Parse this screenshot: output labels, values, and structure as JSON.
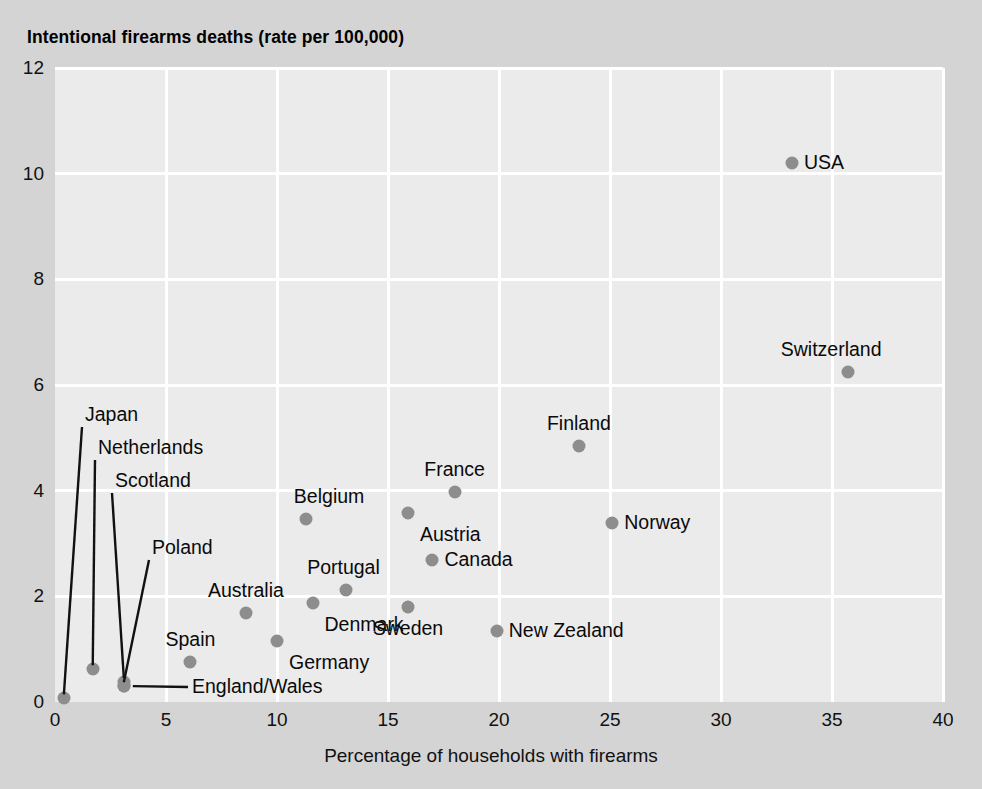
{
  "chart_data": {
    "type": "scatter",
    "title": "Intentional firearms deaths (rate per 100,000)",
    "xlabel": "Percentage of households with firearms",
    "ylabel": "",
    "xlim": [
      0,
      40
    ],
    "ylim": [
      0,
      12
    ],
    "xticks": [
      0,
      5,
      10,
      15,
      20,
      25,
      30,
      35,
      40
    ],
    "yticks": [
      0,
      2,
      4,
      6,
      8,
      10,
      12
    ],
    "grid": true,
    "legend": "none",
    "marker_color": "#8d8d8d",
    "plot_background": "#ebebeb",
    "figure_background": "#d4d4d4",
    "points": [
      {
        "label": "USA",
        "x": 33.2,
        "y": 10.2,
        "label_pos": "right"
      },
      {
        "label": "Switzerland",
        "x": 35.7,
        "y": 6.25,
        "label_pos": "above-left"
      },
      {
        "label": "Finland",
        "x": 23.6,
        "y": 4.85,
        "label_pos": "above"
      },
      {
        "label": "France",
        "x": 18.0,
        "y": 3.97,
        "label_pos": "above"
      },
      {
        "label": "Norway",
        "x": 25.1,
        "y": 3.38,
        "label_pos": "right"
      },
      {
        "label": "Austria",
        "x": 15.9,
        "y": 3.58,
        "label_pos": "below-right"
      },
      {
        "label": "Belgium",
        "x": 11.3,
        "y": 3.47,
        "label_pos": "above-right"
      },
      {
        "label": "Canada",
        "x": 17.0,
        "y": 2.68,
        "label_pos": "right"
      },
      {
        "label": "Portugal",
        "x": 13.1,
        "y": 2.12,
        "label_pos": "above-left"
      },
      {
        "label": "Denmark",
        "x": 11.6,
        "y": 1.88,
        "label_pos": "below-right"
      },
      {
        "label": "Sweden",
        "x": 15.9,
        "y": 1.8,
        "label_pos": "below"
      },
      {
        "label": "Australia",
        "x": 8.6,
        "y": 1.69,
        "label_pos": "above"
      },
      {
        "label": "New Zealand",
        "x": 19.9,
        "y": 1.34,
        "label_pos": "right"
      },
      {
        "label": "Germany",
        "x": 10.0,
        "y": 1.15,
        "label_pos": "below-right"
      },
      {
        "label": "Spain",
        "x": 6.1,
        "y": 0.75,
        "label_pos": "above"
      },
      {
        "label": "Netherlands",
        "x": 1.7,
        "y": 0.62,
        "label_pos": "leader"
      },
      {
        "label": "Scotland",
        "x": 3.1,
        "y": 0.38,
        "label_pos": "leader"
      },
      {
        "label": "England/Wales",
        "x": 3.1,
        "y": 0.3,
        "label_pos": "leader"
      },
      {
        "label": "Poland",
        "x": 3.1,
        "y": 0.3,
        "label_pos": "leader"
      },
      {
        "label": "Japan",
        "x": 0.4,
        "y": 0.07,
        "label_pos": "leader"
      }
    ],
    "leader_labels": [
      {
        "label": "Japan",
        "text_x": 85,
        "text_y": 415
      },
      {
        "label": "Netherlands",
        "text_x": 98,
        "text_y": 448
      },
      {
        "label": "Scotland",
        "text_x": 115,
        "text_y": 481
      },
      {
        "label": "Poland",
        "text_x": 152,
        "text_y": 548
      },
      {
        "label": "England/Wales",
        "text_x": 192,
        "text_y": 687
      }
    ]
  },
  "axis": {
    "x_tick_labels": [
      "0",
      "5",
      "10",
      "15",
      "20",
      "25",
      "30",
      "35",
      "40"
    ],
    "y_tick_labels": [
      "0",
      "2",
      "4",
      "6",
      "8",
      "10",
      "12"
    ]
  }
}
